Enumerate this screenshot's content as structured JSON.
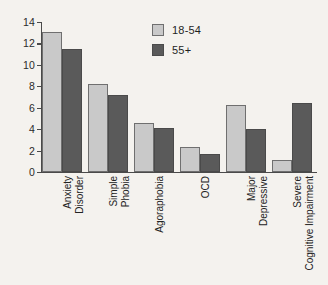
{
  "chart_data": {
    "type": "bar",
    "title": "",
    "xlabel": "",
    "ylabel": "",
    "ylim": [
      0,
      14
    ],
    "yticks": [
      0,
      2,
      4,
      6,
      8,
      10,
      12,
      14
    ],
    "ytick_labels": [
      "0",
      "2",
      "4",
      "6",
      "8",
      "10",
      "12",
      "14"
    ],
    "grid": false,
    "legend_position": "top-center",
    "categories": [
      "Anxiety Disorder",
      "Simple Phobia",
      "Agoraphobia",
      "OCD",
      "Major Depressive",
      "Severe Cognitive Impairment"
    ],
    "category_lines": [
      [
        "Anxiety",
        "Disorder"
      ],
      [
        "Simple",
        "Phobia"
      ],
      [
        "Agoraphobia"
      ],
      [
        "OCD"
      ],
      [
        "Major",
        "Depressive"
      ],
      [
        "Severe",
        "Cognitive Impairment"
      ]
    ],
    "series": [
      {
        "name": "18-54",
        "color": "#c9c9c9",
        "values": [
          13.05,
          8.2,
          4.6,
          2.35,
          6.3,
          1.1
        ]
      },
      {
        "name": "55+",
        "color": "#5a5a5a",
        "values": [
          11.5,
          7.2,
          4.15,
          1.65,
          4.05,
          6.45
        ]
      }
    ]
  },
  "legend": {
    "items": [
      {
        "label": "18-54",
        "swatch": "light"
      },
      {
        "label": "55+",
        "swatch": "dark"
      }
    ]
  },
  "colors": {
    "background": "#f4f2ee",
    "axis": "#4a4a4a",
    "series_18_54": "#c9c9c9",
    "series_55_plus": "#5a5a5a",
    "text": "#232323"
  }
}
